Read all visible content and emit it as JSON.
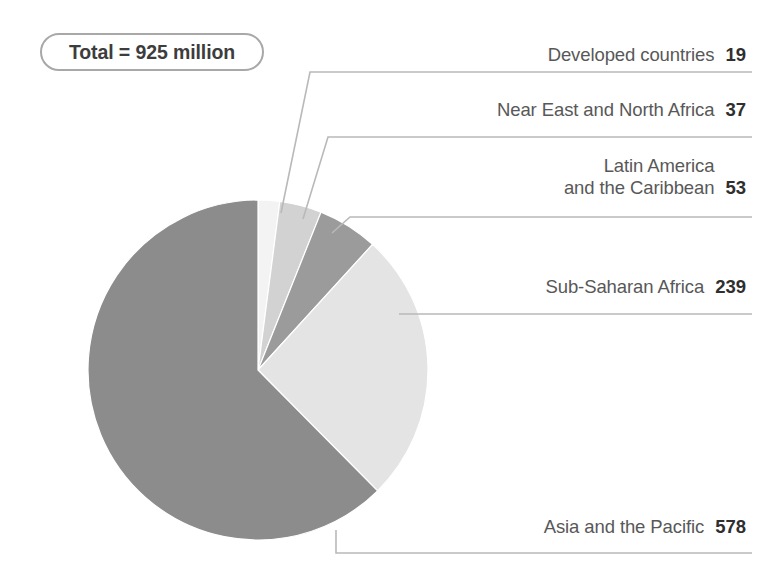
{
  "figure": {
    "badge": {
      "text": "Total = 925 million"
    },
    "background_color": "#ffffff",
    "line_color": "#b4b4b4"
  },
  "chart_data": {
    "type": "pie",
    "title": "Total = 925 million",
    "units": "million people",
    "total": 925,
    "start_angle_deg": 0,
    "direction": "clockwise",
    "legend_position": "callout-labels-right",
    "categories": [
      "Developed countries",
      "Near East and North Africa",
      "Latin America and the Caribbean",
      "Sub-Saharan Africa",
      "Asia and the Pacific"
    ],
    "values": [
      19,
      37,
      53,
      239,
      578
    ],
    "colors": [
      "#f3f3f3",
      "#d2d2d2",
      "#9b9b9b",
      "#e4e4e4",
      "#8c8c8c"
    ],
    "slices": [
      {
        "label": "Developed countries",
        "label_lines": [
          "Developed countries"
        ],
        "value": 19,
        "value_text": "19",
        "color": "#f3f3f3",
        "percent": 2.1
      },
      {
        "label": "Near East and North Africa",
        "label_lines": [
          "Near East and North Africa"
        ],
        "value": 37,
        "value_text": "37",
        "color": "#d2d2d2",
        "percent": 4.0
      },
      {
        "label": "Latin America and the Caribbean",
        "label_lines": [
          "Latin America",
          "and the Caribbean"
        ],
        "value": 53,
        "value_text": "53",
        "color": "#9b9b9b",
        "percent": 5.7
      },
      {
        "label": "Sub-Saharan Africa",
        "label_lines": [
          "Sub-Saharan Africa"
        ],
        "value": 239,
        "value_text": "239",
        "color": "#e4e4e4",
        "percent": 25.8
      },
      {
        "label": "Asia and the Pacific",
        "label_lines": [
          "Asia and the Pacific"
        ],
        "value": 578,
        "value_text": "578",
        "color": "#8c8c8c",
        "percent": 62.5
      }
    ]
  }
}
